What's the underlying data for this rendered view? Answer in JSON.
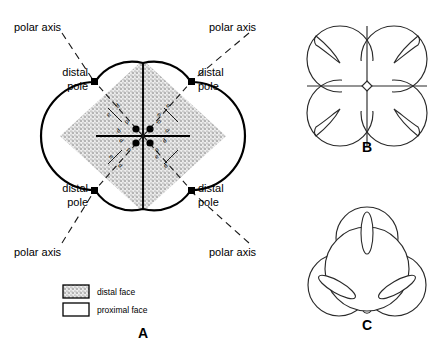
{
  "figure": {
    "panels": [
      {
        "id": "A",
        "letter": "A"
      },
      {
        "id": "B",
        "letter": "B"
      },
      {
        "id": "C",
        "letter": "C"
      }
    ]
  },
  "panel_a": {
    "letter": "A",
    "polar_axis_labels": [
      {
        "id": "top-left",
        "text": "polar axis",
        "x": 14,
        "y": 28,
        "leader": [
          62,
          33,
          104,
          70
        ]
      },
      {
        "id": "top-right",
        "text": "polar axis",
        "x": 207,
        "y": 28,
        "leader": [
          249,
          33,
          207,
          70
        ]
      },
      {
        "id": "bottom-left",
        "text": "polar axis",
        "x": 14,
        "y": 255,
        "leader": [
          62,
          245,
          104,
          208
        ]
      },
      {
        "id": "bottom-right",
        "text": "polar axis",
        "x": 207,
        "y": 255,
        "leader": [
          249,
          245,
          207,
          208
        ]
      }
    ],
    "distal_pole_labels": [
      {
        "id": "upper-left",
        "line1": "distal",
        "line2": "pole",
        "x": 55,
        "y": 78,
        "anchor": "end"
      },
      {
        "id": "upper-right",
        "line1": "distal",
        "line2": "pole",
        "x": 192,
        "y": 78,
        "anchor": "start"
      },
      {
        "id": "lower-left",
        "line1": "distal",
        "line2": "pole",
        "x": 55,
        "y": 192,
        "anchor": "end"
      },
      {
        "id": "lower-right",
        "line1": "distal",
        "line2": "pole",
        "x": 192,
        "y": 192,
        "anchor": "start"
      }
    ],
    "distal_poles": [
      {
        "id": "upper-left",
        "x": 95,
        "y": 82
      },
      {
        "id": "upper-right",
        "x": 191,
        "y": 82
      },
      {
        "id": "lower-left",
        "x": 95,
        "y": 190
      },
      {
        "id": "lower-right",
        "x": 191,
        "y": 190
      }
    ],
    "proximal_poles": [
      {
        "id": "center-upper-left",
        "x": 137,
        "y": 129
      },
      {
        "id": "center-upper-right",
        "x": 149,
        "y": 129
      },
      {
        "id": "center-lower-left",
        "x": 137,
        "y": 141
      },
      {
        "id": "center-lower-right",
        "x": 149,
        "y": 141
      }
    ],
    "axis_markers": [
      {
        "id": "q1-inner-p",
        "text": "p",
        "x": 131,
        "y": 124,
        "rot": -45
      },
      {
        "id": "q1-inner-d",
        "text": "d",
        "x": 124,
        "y": 131,
        "rot": -45
      },
      {
        "id": "q1-outer-d",
        "text": "d",
        "x": 117,
        "y": 110,
        "rot": -45
      },
      {
        "id": "q1-outer-e",
        "text": "e",
        "x": 110,
        "y": 117,
        "rot": -45
      },
      {
        "id": "q2-inner-p",
        "text": "p",
        "x": 155,
        "y": 124,
        "rot": 45
      },
      {
        "id": "q2-inner-d",
        "text": "d",
        "x": 162,
        "y": 131,
        "rot": 45
      },
      {
        "id": "q2-outer-d",
        "text": "d",
        "x": 169,
        "y": 110,
        "rot": 45
      },
      {
        "id": "q2-outer-e",
        "text": "e",
        "x": 162,
        "y": 117,
        "rot": 45
      },
      {
        "id": "q3-inner-p",
        "text": "p",
        "x": 131,
        "y": 147,
        "rot": 45
      },
      {
        "id": "q3-inner-d",
        "text": "d",
        "x": 124,
        "y": 140,
        "rot": 45
      },
      {
        "id": "q3-outer-d",
        "text": "d",
        "x": 117,
        "y": 160,
        "rot": 45
      },
      {
        "id": "q3-outer-e",
        "text": "e",
        "x": 110,
        "y": 153,
        "rot": 45
      },
      {
        "id": "q4-inner-p",
        "text": "p",
        "x": 155,
        "y": 147,
        "rot": -45
      },
      {
        "id": "q4-inner-d",
        "text": "d",
        "x": 162,
        "y": 140,
        "rot": -45
      },
      {
        "id": "q4-outer-d",
        "text": "d",
        "x": 169,
        "y": 160,
        "rot": -45
      },
      {
        "id": "q4-outer-e",
        "text": "e",
        "x": 162,
        "y": 153,
        "rot": -45
      }
    ]
  },
  "legend": {
    "items": [
      {
        "id": "distal-face",
        "label": "distal face",
        "fill": "stipple"
      },
      {
        "id": "proximal-face",
        "label": "proximal face",
        "fill": "white"
      }
    ]
  },
  "colors": {
    "stroke": "#000000",
    "stipple_bg": "#e8e8e8",
    "stipple_dot": "#6b6b6b",
    "background": "#ffffff",
    "thin_stroke": "#1a1a1a"
  }
}
